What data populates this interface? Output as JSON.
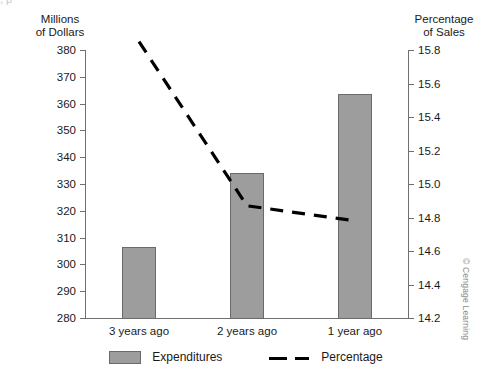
{
  "top_crop_text": ",                    p",
  "credit": "© Cengage Learning",
  "left_axis": {
    "title_line1": "Millions",
    "title_line2": "of Dollars",
    "ticks": [
      "380",
      "370",
      "360",
      "350",
      "340",
      "330",
      "320",
      "310",
      "300",
      "290",
      "280"
    ]
  },
  "right_axis": {
    "title_line1": "Percentage",
    "title_line2": "of Sales",
    "ticks": [
      "15.8",
      "15.6",
      "15.4",
      "15.2",
      "15.0",
      "14.8",
      "14.6",
      "14.4",
      "14.2"
    ]
  },
  "legend": [
    {
      "label": "Expenditures",
      "marker": "bar-swatch",
      "color": "#9d9d9d"
    },
    {
      "label": "Percentage",
      "marker": "dashed-line",
      "color": "#000000"
    }
  ],
  "colors": {
    "bar_fill": "#9d9d9d",
    "bar_stroke": "#6a6a6a",
    "line": "#000000",
    "axis": "#6f6f6f",
    "text": "#1a1a1a",
    "credit": "#8a8a8a"
  },
  "chart_data": {
    "type": "bar",
    "title": "",
    "subtitle": "",
    "xlabel": "",
    "ylabel": "Millions of Dollars",
    "y2label": "Percentage of Sales",
    "categories": [
      "3 years ago",
      "2 years ago",
      "1 year ago"
    ],
    "grid": false,
    "legend_position": "bottom",
    "ylim": [
      280,
      380
    ],
    "ytick_step": 10,
    "y2lim": [
      14.2,
      15.8
    ],
    "y2tick_step": 0.2,
    "series": [
      {
        "name": "Expenditures",
        "type": "bar",
        "axis": "left",
        "unit": "millions of dollars",
        "values": [
          306.5,
          334,
          363.5
        ]
      },
      {
        "name": "Percentage",
        "type": "line",
        "style": "dashed",
        "axis": "right",
        "unit": "percentage of sales",
        "values": [
          15.85,
          14.87,
          14.78
        ]
      }
    ]
  }
}
